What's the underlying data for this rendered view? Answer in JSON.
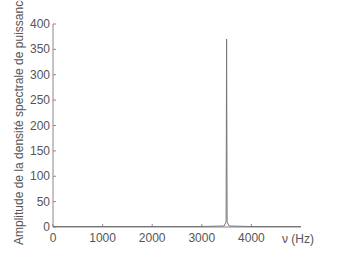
{
  "chart_data": {
    "type": "line",
    "title": "",
    "xlabel": "ν (Hz)",
    "ylabel": "Amplitude de la densité spectrale de puissance",
    "xlim": [
      0,
      5000
    ],
    "ylim": [
      0,
      400
    ],
    "xticks": [
      0,
      1000,
      2000,
      3000,
      4000
    ],
    "yticks": [
      0,
      50,
      100,
      150,
      200,
      250,
      300,
      350,
      400
    ],
    "grid": false,
    "legend": null,
    "series": [
      {
        "name": "DSP",
        "x": [
          0,
          1000,
          2000,
          3000,
          3450,
          3490,
          3500,
          3510,
          3550,
          4000,
          5000
        ],
        "y": [
          1,
          1,
          1,
          1,
          2,
          10,
          370,
          10,
          2,
          1,
          1
        ]
      }
    ],
    "peak": {
      "frequency_hz": 3500,
      "amplitude": 370
    }
  }
}
